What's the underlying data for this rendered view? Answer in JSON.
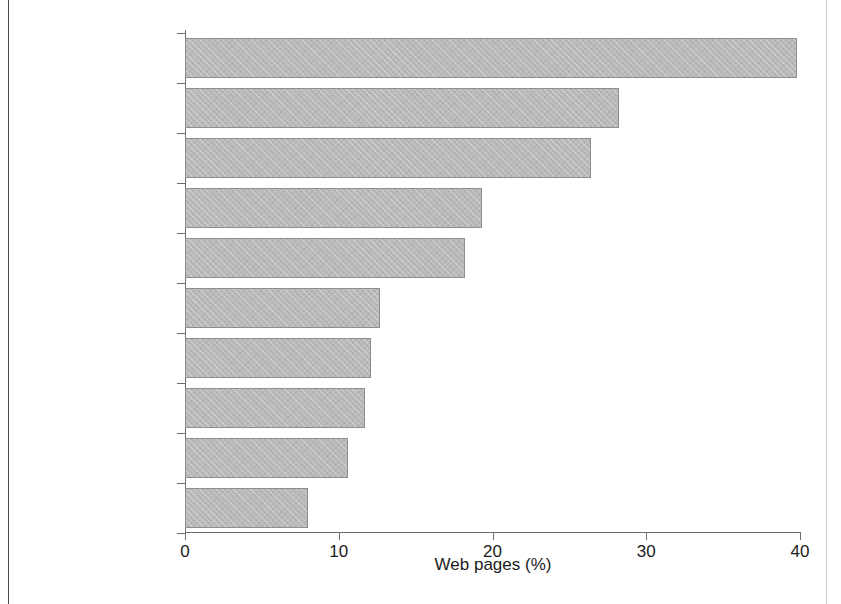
{
  "figure": {
    "background_color": "#ffffff",
    "bar_fill_color": "#b9b9b9",
    "bar_edge_color": "#8e8e8e",
    "axis_color": "#6e6e6e",
    "text_color": "#1b1b1b"
  },
  "chart_data": {
    "type": "bar",
    "orientation": "horizontal",
    "title": "",
    "subtitle": "",
    "xlabel": "Web pages (%)",
    "ylabel": "",
    "xlim": [
      0,
      40
    ],
    "xticks": [
      0,
      10,
      20,
      30,
      40
    ],
    "xtick_labels": [
      "0",
      "10",
      "20",
      "30",
      "40"
    ],
    "grid": false,
    "legend": null,
    "categories": [
      "Call for action",
      "Publication",
      "Discovery",
      "Controversy",
      "Meeting",
      "Technology",
      "Trade",
      "Hunting",
      "Protected areas",
      "Poaching"
    ],
    "values": [
      39.8,
      28.2,
      26.4,
      19.3,
      18.2,
      12.7,
      12.1,
      11.7,
      10.6,
      8.0
    ],
    "value_unit": "%",
    "annotations": []
  }
}
